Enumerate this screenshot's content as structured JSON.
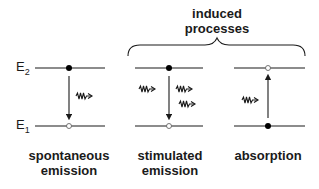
{
  "title": {
    "line1": "induced",
    "line2": "processes"
  },
  "levels": {
    "upper": {
      "symbol": "E",
      "subscript": "2"
    },
    "lower": {
      "symbol": "E",
      "subscript": "1"
    }
  },
  "processes": [
    {
      "name": "spontaneous emission",
      "line1": "spontaneous",
      "line2": "emission",
      "upper_state": "filled",
      "lower_state": "empty",
      "transition": "down",
      "incoming_photons": 0,
      "outgoing_photons": 1
    },
    {
      "name": "stimulated emission",
      "line1": "stimulated",
      "line2": "emission",
      "upper_state": "filled",
      "lower_state": "empty",
      "transition": "down",
      "incoming_photons": 1,
      "outgoing_photons": 2
    },
    {
      "name": "absorption",
      "line1": "absorption",
      "line2": "",
      "upper_state": "empty",
      "lower_state": "filled",
      "transition": "up",
      "incoming_photons": 1,
      "outgoing_photons": 0
    }
  ],
  "colors": {
    "line": "#1a1a1a",
    "background": "#ffffff"
  }
}
